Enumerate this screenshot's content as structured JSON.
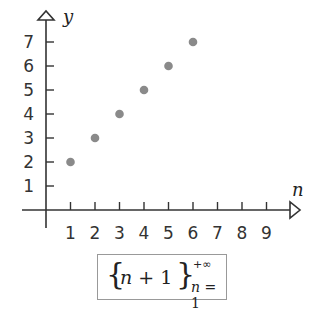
{
  "chart_data": {
    "type": "scatter",
    "title": "",
    "xlabel": "n",
    "ylabel": "y",
    "x": [
      1,
      2,
      3,
      4,
      5,
      6
    ],
    "series": [
      {
        "name": "n+1",
        "values": [
          2,
          3,
          4,
          5,
          6,
          7
        ]
      }
    ],
    "x_ticks": [
      "1",
      "2",
      "3",
      "4",
      "5",
      "6",
      "7",
      "8",
      "9"
    ],
    "y_ticks": [
      "1",
      "2",
      "3",
      "4",
      "5",
      "6",
      "7"
    ],
    "xlim": [
      0,
      10
    ],
    "ylim": [
      0,
      8
    ],
    "grid": false,
    "legend": "none",
    "annotation": "{ n + 1 } from n = 1 to +∞",
    "marker_color": "#8a8a8a"
  },
  "axes": {
    "x_label": "n",
    "y_label": "y"
  },
  "formula": {
    "open_brace": "{",
    "expr_var": "n",
    "expr_rest": " + 1",
    "close_brace": "}",
    "upper": "+∞",
    "lower_var": "n",
    "lower_rest": " = 1"
  }
}
